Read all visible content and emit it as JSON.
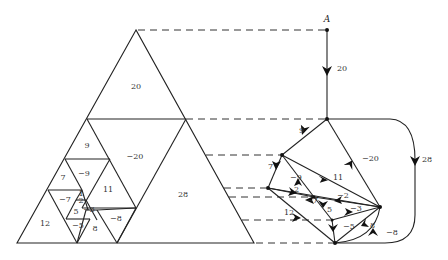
{
  "diagram": {
    "type": "squared-triangle dissection and its associated directed graph",
    "source_label": "A",
    "triangle_labels": [
      {
        "text": "20",
        "x": 136,
        "y": 87
      },
      {
        "text": "9",
        "x": 87,
        "y": 146
      },
      {
        "text": "−20",
        "x": 135,
        "y": 157
      },
      {
        "text": "7",
        "x": 63,
        "y": 178
      },
      {
        "text": "−9",
        "x": 84,
        "y": 174
      },
      {
        "text": "11",
        "x": 108,
        "y": 190
      },
      {
        "text": "28",
        "x": 183,
        "y": 195
      },
      {
        "text": "−7",
        "x": 65,
        "y": 200
      },
      {
        "text": "1",
        "x": 81,
        "y": 194
      },
      {
        "text": "2",
        "x": 81,
        "y": 201
      },
      {
        "text": "5",
        "x": 76,
        "y": 212
      },
      {
        "text": "−3",
        "x": 89,
        "y": 210
      },
      {
        "text": "−8",
        "x": 116,
        "y": 219
      },
      {
        "text": "12",
        "x": 45,
        "y": 224
      },
      {
        "text": "−5",
        "x": 78,
        "y": 226
      },
      {
        "text": "8",
        "x": 95,
        "y": 229
      }
    ],
    "graph_edge_labels": [
      {
        "text": "20",
        "x": 337,
        "y": 69
      },
      {
        "text": "9",
        "x": 299,
        "y": 131
      },
      {
        "text": "−20",
        "x": 362,
        "y": 159
      },
      {
        "text": "28",
        "x": 422,
        "y": 160
      },
      {
        "text": "7",
        "x": 268,
        "y": 167
      },
      {
        "text": "−9",
        "x": 290,
        "y": 178
      },
      {
        "text": "11",
        "x": 333,
        "y": 178
      },
      {
        "text": "2",
        "x": 294,
        "y": 190
      },
      {
        "text": "−2",
        "x": 337,
        "y": 196
      },
      {
        "text": "−7",
        "x": 306,
        "y": 201
      },
      {
        "text": "5",
        "x": 327,
        "y": 210
      },
      {
        "text": "−3",
        "x": 350,
        "y": 209
      },
      {
        "text": "12",
        "x": 284,
        "y": 213
      },
      {
        "text": "−5",
        "x": 343,
        "y": 227
      },
      {
        "text": "8",
        "x": 370,
        "y": 226
      },
      {
        "text": "−8",
        "x": 386,
        "y": 233
      }
    ]
  }
}
